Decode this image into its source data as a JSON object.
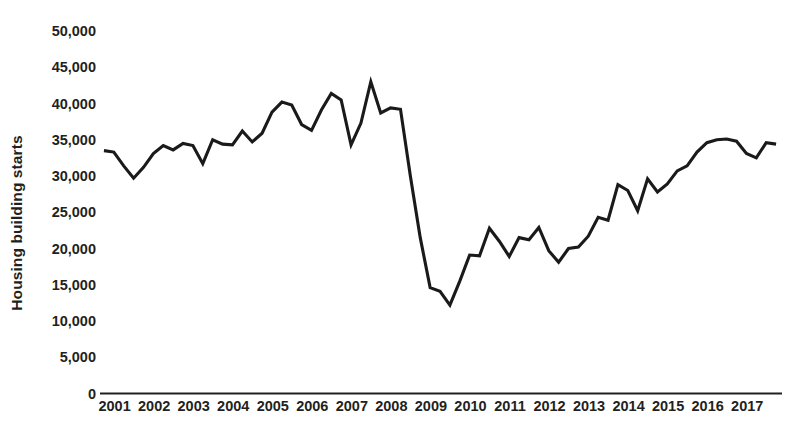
{
  "chart_data": {
    "type": "line",
    "title": "",
    "subtitle": "",
    "xlabel": "",
    "ylabel": "Housing building starts",
    "ylim": [
      0,
      50000
    ],
    "xlim": [
      2000.75,
      2018.0
    ],
    "grid": false,
    "legend": null,
    "y_ticks": [
      0,
      5000,
      10000,
      15000,
      20000,
      25000,
      30000,
      35000,
      40000,
      45000,
      50000
    ],
    "y_tick_labels": [
      "0",
      "5,000",
      "10,000",
      "15,000",
      "20,000",
      "25,000",
      "30,000",
      "35,000",
      "40,000",
      "45,000",
      "50,000"
    ],
    "x_ticks": [
      2001,
      2002,
      2003,
      2004,
      2005,
      2006,
      2007,
      2008,
      2009,
      2010,
      2011,
      2012,
      2013,
      2014,
      2015,
      2016,
      2017
    ],
    "x_tick_labels": [
      "2001",
      "2002",
      "2003",
      "2004",
      "2005",
      "2006",
      "2007",
      "2008",
      "2009",
      "2010",
      "2011",
      "2012",
      "2013",
      "2014",
      "2015",
      "2016",
      "2017"
    ],
    "frequency": "quarterly",
    "line_color": "#1a1a1a",
    "axis_color": "#231f20",
    "series": [
      {
        "name": "Housing building starts",
        "x": [
          2000.85,
          2001.1,
          2001.35,
          2001.6,
          2001.85,
          2002.1,
          2002.35,
          2002.6,
          2002.85,
          2003.1,
          2003.35,
          2003.6,
          2003.85,
          2004.1,
          2004.35,
          2004.6,
          2004.85,
          2005.1,
          2005.35,
          2005.6,
          2005.85,
          2006.1,
          2006.35,
          2006.6,
          2006.85,
          2007.1,
          2007.35,
          2007.6,
          2007.85,
          2008.1,
          2008.35,
          2008.6,
          2008.85,
          2009.1,
          2009.35,
          2009.6,
          2009.85,
          2010.1,
          2010.35,
          2010.6,
          2010.85,
          2011.1,
          2011.35,
          2011.6,
          2011.85,
          2012.1,
          2012.35,
          2012.6,
          2012.85,
          2013.1,
          2013.35,
          2013.6,
          2013.85,
          2014.1,
          2014.35,
          2014.6,
          2014.85,
          2015.1,
          2015.35,
          2015.6,
          2015.85,
          2016.1,
          2016.35,
          2016.6,
          2016.85,
          2017.1,
          2017.35,
          2017.6,
          2017.85
        ],
        "values": [
          33500,
          33300,
          31400,
          29700,
          31200,
          33100,
          34200,
          33600,
          34500,
          34200,
          31700,
          35000,
          34400,
          34300,
          36200,
          34700,
          35900,
          38800,
          40200,
          39800,
          37100,
          36300,
          39100,
          41400,
          40500,
          34300,
          37300,
          43000,
          38700,
          39400,
          39200,
          30000,
          21500,
          14600,
          14100,
          12200,
          15500,
          19100,
          19000,
          22800,
          21000,
          18900,
          21500,
          21200,
          22900,
          19700,
          18100,
          20000,
          20200,
          21700,
          24300,
          23900,
          28800,
          28000,
          25200,
          29600,
          27800,
          28900,
          30700,
          31400,
          33300,
          34600,
          35000,
          35100,
          34800,
          33100,
          32500,
          34600,
          34400
        ]
      }
    ]
  },
  "axis": {
    "y_title": "Housing building starts"
  }
}
